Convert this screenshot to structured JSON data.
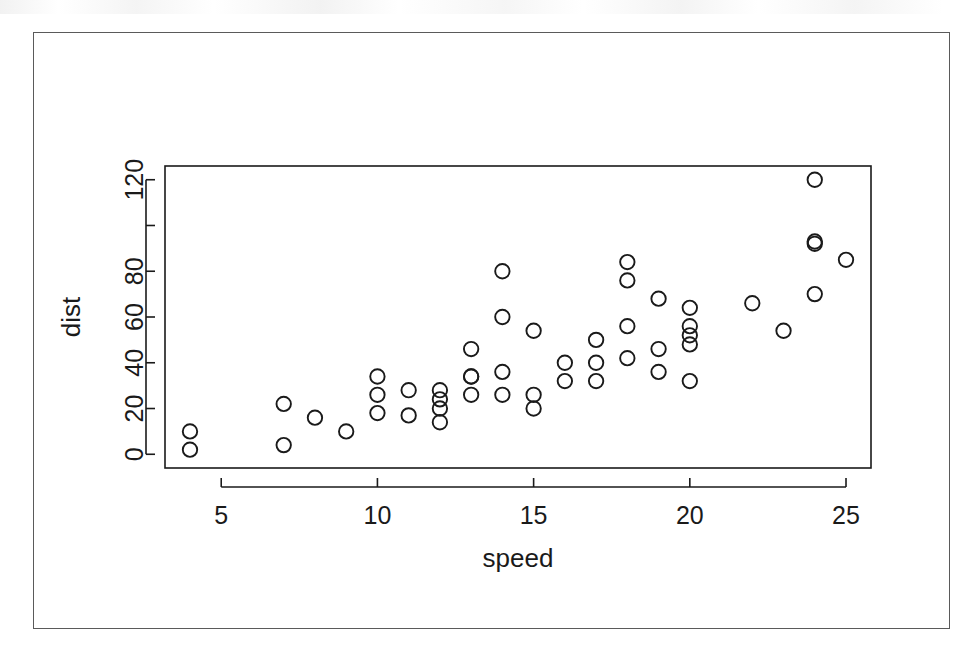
{
  "figure": {
    "frame_color": "#5a5a5a",
    "background": "#ffffff",
    "ink_color": "#1a1a1a"
  },
  "axis_labels": {
    "x": "speed",
    "y": "dist"
  },
  "chart_data": {
    "type": "scatter",
    "title": "",
    "xlabel": "speed",
    "ylabel": "dist",
    "xlim": [
      3.2,
      25.8
    ],
    "ylim": [
      -6,
      126
    ],
    "xticks": [
      5,
      10,
      15,
      20,
      25
    ],
    "xtick_labels": [
      "5",
      "10",
      "15",
      "20",
      "25"
    ],
    "yticks": [
      0,
      20,
      40,
      60,
      80,
      100,
      120
    ],
    "ytick_labels": [
      "0",
      "20",
      "40",
      "60",
      "80",
      "",
      "120"
    ],
    "grid": false,
    "legend": null,
    "marker": "open-circle",
    "n_points": 50,
    "x": [
      4,
      4,
      7,
      7,
      8,
      9,
      10,
      10,
      10,
      11,
      11,
      12,
      12,
      12,
      12,
      13,
      13,
      13,
      13,
      14,
      14,
      14,
      14,
      15,
      15,
      15,
      16,
      16,
      17,
      17,
      17,
      18,
      18,
      18,
      18,
      19,
      19,
      19,
      20,
      20,
      20,
      20,
      20,
      22,
      23,
      24,
      24,
      24,
      24,
      25
    ],
    "y": [
      2,
      10,
      4,
      22,
      16,
      10,
      18,
      26,
      34,
      17,
      28,
      14,
      20,
      24,
      28,
      26,
      34,
      34,
      46,
      26,
      36,
      60,
      80,
      20,
      26,
      54,
      32,
      40,
      32,
      40,
      50,
      42,
      56,
      76,
      84,
      36,
      46,
      68,
      32,
      48,
      52,
      56,
      64,
      66,
      54,
      70,
      92,
      93,
      120,
      85
    ]
  }
}
